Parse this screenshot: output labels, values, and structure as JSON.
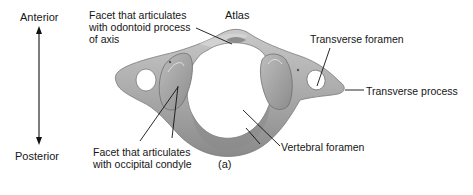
{
  "figure": {
    "title": "Atlas",
    "panel_label": "(a)",
    "orientation": {
      "top": "Anterior",
      "bottom": "Posterior"
    },
    "labels": {
      "facet_odontoid": "Facet that articulates\nwith odontoid process\nof axis",
      "transverse_foramen": "Transverse foramen",
      "transverse_process": "Transverse process",
      "vertebral_foramen": "Vertebral foramen",
      "facet_occipital": "Facet that articulates\nwith occipital condyle"
    },
    "colors": {
      "bone": "#a9a9a9",
      "bone_light": "#c8c8c8",
      "bone_dark": "#7e7e7e",
      "line": "#111111",
      "background": "#ffffff"
    }
  }
}
